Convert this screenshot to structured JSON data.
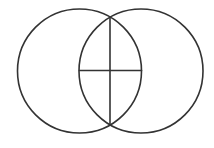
{
  "canvas": {
    "width": 214,
    "height": 148,
    "background": "#ffffff"
  },
  "style": {
    "stroke": "#333333",
    "stroke_width": 1.6
  },
  "diagram": {
    "type": "vesica-piscis",
    "circles": [
      {
        "name": "left-circle",
        "cx": 79.5,
        "cy": 71,
        "r": 62
      },
      {
        "name": "right-circle",
        "cx": 141,
        "cy": 71,
        "r": 62
      }
    ],
    "lines": [
      {
        "name": "vertical-axis-line",
        "x1": 110,
        "y1": 17,
        "x2": 110,
        "y2": 124
      },
      {
        "name": "horizontal-axis-line",
        "x1": 79.5,
        "y1": 70.5,
        "x2": 141.5,
        "y2": 70.5
      }
    ]
  }
}
